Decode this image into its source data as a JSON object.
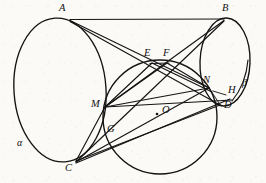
{
  "figure": {
    "width": 266,
    "height": 183,
    "stroke_color": "#141414",
    "background_color": "#fbfaf7"
  },
  "labels": {
    "A": "A",
    "B": "B",
    "C": "C",
    "D": "D",
    "E": "E",
    "F": "F",
    "G": "G",
    "H": "H",
    "M": "M",
    "N": "N",
    "O": "O",
    "alpha": "α",
    "beta": "β"
  },
  "points": [
    {
      "id": "A",
      "label": "A",
      "x": 70,
      "y": 19,
      "label_x": 59,
      "label_y": 3
    },
    {
      "id": "B",
      "label": "B",
      "x": 224,
      "y": 19,
      "label_x": 222,
      "label_y": 3
    },
    {
      "id": "C",
      "label": "C",
      "x": 76,
      "y": 162,
      "label_x": 66,
      "label_y": 163
    },
    {
      "id": "D",
      "label": "D",
      "x": 220,
      "y": 105,
      "label_x": 224,
      "label_y": 101
    },
    {
      "id": "E",
      "label": "E",
      "x": 152,
      "y": 63,
      "label_x": 145,
      "label_y": 48
    },
    {
      "id": "F",
      "label": "F",
      "x": 167,
      "y": 63,
      "label_x": 163,
      "label_y": 48
    },
    {
      "id": "G",
      "label": "G",
      "x": 113,
      "y": 132,
      "label_x": 108,
      "label_y": 124
    },
    {
      "id": "H",
      "label": "H",
      "x": 224,
      "y": 95,
      "label_x": 228,
      "label_y": 85
    },
    {
      "id": "M",
      "label": "M",
      "x": 105,
      "y": 107,
      "label_x": 92,
      "label_y": 100
    },
    {
      "id": "N",
      "label": "N",
      "x": 209,
      "y": 88,
      "label_x": 204,
      "label_y": 76
    },
    {
      "id": "O",
      "label": "O",
      "x": 164,
      "y": 113,
      "label_x": 168,
      "label_y": 106
    }
  ],
  "greek_labels": [
    {
      "id": "alpha",
      "label": "α",
      "label_x": 17,
      "label_y": 138
    },
    {
      "id": "beta",
      "label": "β",
      "label_x": 243,
      "label_y": 78
    }
  ],
  "conics": [
    {
      "id": "ellipse-alpha",
      "name": "left-base-ellipse",
      "cx": 60,
      "cy": 90,
      "rx": 46,
      "ry": 72,
      "rotation": -4
    },
    {
      "id": "ellipse-beta",
      "name": "right-base-ellipse",
      "cx": 225,
      "cy": 62,
      "rx": 25,
      "ry": 44,
      "rotation": 2
    },
    {
      "id": "circle-sphere",
      "name": "inscribed-sphere-great-circle",
      "cx": 160,
      "cy": 117,
      "rx": 57,
      "ry": 57,
      "rotation": 0
    }
  ],
  "segments": [
    {
      "name": "segment-AB",
      "from": "A",
      "to": "B"
    },
    {
      "name": "segment-AN",
      "from": "A",
      "to": "N"
    },
    {
      "name": "segment-AD",
      "from": "A",
      "to": "D"
    },
    {
      "name": "segment-BM",
      "from": "B",
      "to": "M"
    },
    {
      "name": "segment-BC",
      "from": "B",
      "to": "C"
    },
    {
      "name": "segment-CD",
      "from": "C",
      "to": "D"
    },
    {
      "name": "segment-CN",
      "from": "C",
      "to": "N"
    },
    {
      "name": "segment-CH",
      "from": "C",
      "to": "H"
    },
    {
      "name": "segment-CM",
      "from": "C",
      "to": "M"
    },
    {
      "name": "segment-ME",
      "from": "M",
      "to": "E"
    },
    {
      "name": "segment-MF",
      "from": "M",
      "to": "F"
    },
    {
      "name": "segment-MN",
      "from": "M",
      "to": "N"
    },
    {
      "name": "segment-MD",
      "from": "M",
      "to": "D"
    },
    {
      "name": "segment-EN",
      "from": "E",
      "to": "N"
    },
    {
      "name": "segment-FN",
      "from": "F",
      "to": "N"
    },
    {
      "name": "segment-MG",
      "from": "M",
      "to": "G"
    },
    {
      "name": "segment-ND",
      "from": "N",
      "to": "D"
    }
  ],
  "markers": [
    {
      "name": "center-dot-O",
      "x": 157,
      "y": 114,
      "r": 1.3
    }
  ]
}
